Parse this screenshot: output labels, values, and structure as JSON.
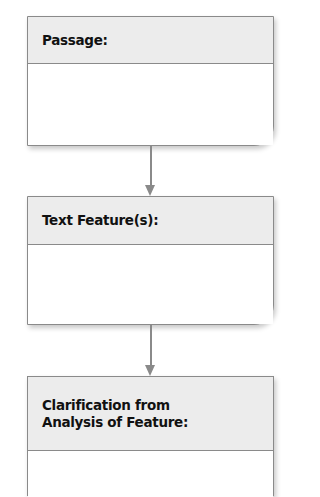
{
  "diagram": {
    "type": "flowchart",
    "direction": "top-to-bottom",
    "colors": {
      "border": "#8a8a8a",
      "header_bg": "#ececec",
      "body_bg": "#ffffff",
      "text": "#111111",
      "arrow": "#8a8a8a"
    },
    "boxes": [
      {
        "label": "Passage:"
      },
      {
        "label": "Text Feature(s):"
      },
      {
        "label_line1": "Clarification from",
        "label_line2": "Analysis of Feature:"
      }
    ],
    "arrows": [
      {
        "from": "Passage:",
        "to": "Text Feature(s):"
      },
      {
        "from": "Text Feature(s):",
        "to": "Clarification from Analysis of Feature:"
      }
    ]
  }
}
